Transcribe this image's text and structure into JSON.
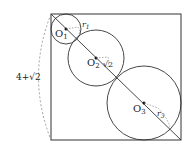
{
  "diagram": {
    "side_label": "4+√2",
    "circles": [
      {
        "center_label": "O",
        "center_sub": "1",
        "radius_label": "r",
        "radius_sub": "1"
      },
      {
        "center_label": "O",
        "center_sub": "2",
        "radius_label": "√2"
      },
      {
        "center_label": "O",
        "center_sub": "3",
        "radius_label": "r",
        "radius_sub": "3"
      }
    ],
    "colors": {
      "stroke": "#333333",
      "dashed": "#888888"
    }
  }
}
